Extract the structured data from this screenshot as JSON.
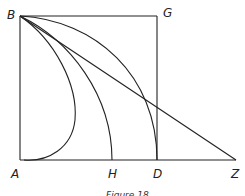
{
  "figure": {
    "caption": "Figure 18",
    "points": {
      "B": {
        "label": "B",
        "x": 20,
        "y": 16
      },
      "G": {
        "label": "G",
        "x": 157,
        "y": 16
      },
      "A": {
        "label": "A",
        "x": 20,
        "y": 160
      },
      "H": {
        "label": "H",
        "x": 112,
        "y": 160
      },
      "D": {
        "label": "D",
        "x": 157,
        "y": 160
      },
      "Z": {
        "label": "Z",
        "x": 236,
        "y": 160
      }
    },
    "segments": [
      {
        "name": "BG",
        "from": "B",
        "to": "G"
      },
      {
        "name": "GD",
        "from": "G",
        "to": "D"
      },
      {
        "name": "BA",
        "from": "B",
        "to": "A"
      },
      {
        "name": "AZ",
        "from": "A",
        "to": "Z"
      },
      {
        "name": "BZ",
        "from": "B",
        "to": "Z"
      }
    ],
    "curves": [
      {
        "name": "curve-B-to-A",
        "from": "B",
        "to": "A"
      },
      {
        "name": "curve-B-to-H",
        "from": "B",
        "to": "H"
      },
      {
        "name": "curve-B-to-D",
        "from": "B",
        "to": "D"
      }
    ],
    "stroke_color": "#222222",
    "background": "#ffffff"
  }
}
